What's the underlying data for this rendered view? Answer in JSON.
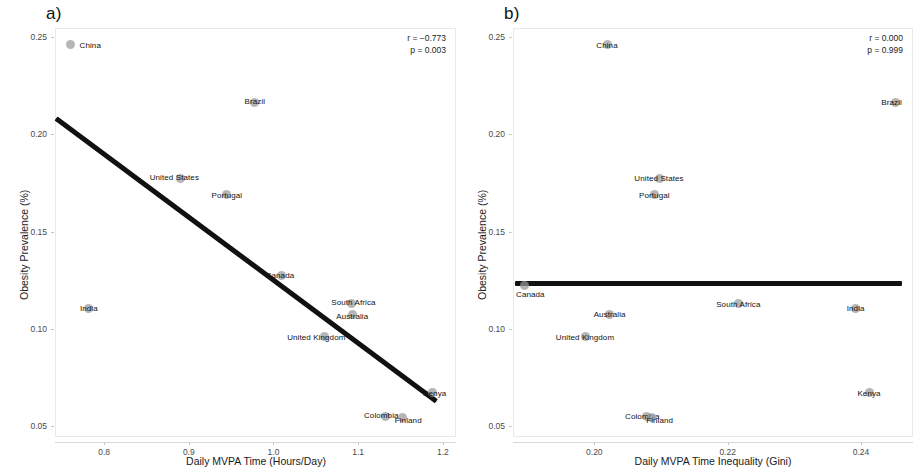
{
  "figure": {
    "panels": [
      {
        "letter": "a)",
        "stats": {
          "r": "r = −0.773",
          "p": "p = 0.003"
        },
        "chart_index": 0
      },
      {
        "letter": "b)",
        "stats": {
          "r": "r = 0.000",
          "p": "p = 0.999"
        },
        "chart_index": 1
      }
    ]
  },
  "chart_data": [
    {
      "type": "scatter",
      "title": "a)",
      "xlabel": "Daily MVPA Time (Hours/Day)",
      "ylabel": "Obesity Prevalence (%)",
      "xlim": [
        0.742,
        1.2155
      ],
      "ylim": [
        0.0446,
        0.2545
      ],
      "xticks": [
        0.8,
        0.9,
        1.0,
        1.1,
        1.2
      ],
      "xtick_labels": [
        "0.8",
        "0.9",
        "1.0",
        "1.1",
        "1.2"
      ],
      "yticks": [
        0.05,
        0.1,
        0.15,
        0.2,
        0.25
      ],
      "ytick_labels": [
        "0.05",
        "0.10",
        "0.15",
        "0.20",
        "0.25"
      ],
      "grid": false,
      "legend": false,
      "annotations": [
        "r = −0.773",
        "p = 0.003"
      ],
      "correlation_r": -0.773,
      "p_value": 0.003,
      "points": [
        {
          "label": "China",
          "x": 0.76,
          "y": 0.246,
          "label_dx": 20,
          "label_dy": 0
        },
        {
          "label": "Brazil",
          "x": 0.978,
          "y": 0.2163,
          "label_dx": 0,
          "label_dy": -1
        },
        {
          "label": "United States",
          "x": 0.89,
          "y": 0.1773,
          "label_dx": -6,
          "label_dy": -1
        },
        {
          "label": "Portugal",
          "x": 0.945,
          "y": 0.1688,
          "label_dx": 0,
          "label_dy": 0
        },
        {
          "label": "Canada",
          "x": 1.01,
          "y": 0.1275,
          "label_dx": -2,
          "label_dy": 0
        },
        {
          "label": "South Africa",
          "x": 1.092,
          "y": 0.113,
          "label_dx": 2,
          "label_dy": -2
        },
        {
          "label": "Australia",
          "x": 1.093,
          "y": 0.1075,
          "label_dx": 0,
          "label_dy": 2
        },
        {
          "label": "India",
          "x": 0.782,
          "y": 0.1108,
          "label_dx": 0,
          "label_dy": 0
        },
        {
          "label": "United Kingdom",
          "x": 1.06,
          "y": 0.096,
          "label_dx": -8,
          "label_dy": 0
        },
        {
          "label": "Kenya",
          "x": 1.188,
          "y": 0.0673,
          "label_dx": 2,
          "label_dy": 0
        },
        {
          "label": "Colombia",
          "x": 1.132,
          "y": 0.0553,
          "label_dx": -4,
          "label_dy": -1
        },
        {
          "label": "Finland",
          "x": 1.152,
          "y": 0.0545,
          "label_dx": 6,
          "label_dy": 2
        }
      ],
      "trend": {
        "x1": 0.7437,
        "y1": 0.2083,
        "x2": 1.1925,
        "y2": 0.0633
      }
    },
    {
      "type": "scatter",
      "title": "b)",
      "xlabel": "Daily MVPA Time Inequality (Gini)",
      "ylabel": "Obesity Prevalence (%)",
      "xlim": [
        0.1878,
        0.2478
      ],
      "ylim": [
        0.0446,
        0.2545
      ],
      "xticks": [
        0.2,
        0.22,
        0.24
      ],
      "xtick_labels": [
        "0.20",
        "0.22",
        "0.24"
      ],
      "yticks": [
        0.05,
        0.1,
        0.15,
        0.2,
        0.25
      ],
      "ytick_labels": [
        "0.05",
        "0.10",
        "0.15",
        "0.20",
        "0.25"
      ],
      "grid": false,
      "legend": false,
      "annotations": [
        "r = 0.000",
        "p = 0.999"
      ],
      "correlation_r": 0.0,
      "p_value": 0.999,
      "points": [
        {
          "label": "China",
          "x": 0.2019,
          "y": 0.246,
          "label_dx": 0,
          "label_dy": 0
        },
        {
          "label": "Brazil",
          "x": 0.2452,
          "y": 0.2163,
          "label_dx": -4,
          "label_dy": 0
        },
        {
          "label": "United States",
          "x": 0.2097,
          "y": 0.1773,
          "label_dx": 0,
          "label_dy": 0
        },
        {
          "label": "Portugal",
          "x": 0.209,
          "y": 0.1688,
          "label_dx": 0,
          "label_dy": 0
        },
        {
          "label": "Canada",
          "x": 0.1895,
          "y": 0.1225,
          "label_dx": 6,
          "label_dy": 9
        },
        {
          "label": "South Africa",
          "x": 0.2216,
          "y": 0.113,
          "label_dx": 0,
          "label_dy": 0
        },
        {
          "label": "India",
          "x": 0.2392,
          "y": 0.1108,
          "label_dx": 0,
          "label_dy": 0
        },
        {
          "label": "Australia",
          "x": 0.2023,
          "y": 0.1075,
          "label_dx": 0,
          "label_dy": 0
        },
        {
          "label": "United Kingdom",
          "x": 0.1986,
          "y": 0.096,
          "label_dx": 0,
          "label_dy": 0
        },
        {
          "label": "Kenya",
          "x": 0.2412,
          "y": 0.0673,
          "label_dx": 0,
          "label_dy": 0
        },
        {
          "label": "Colombia",
          "x": 0.2078,
          "y": 0.0553,
          "label_dx": -4,
          "label_dy": 0
        },
        {
          "label": "Finland",
          "x": 0.2086,
          "y": 0.0545,
          "label_dx": 8,
          "label_dy": 2
        }
      ],
      "trend": {
        "x1": 0.1881,
        "y1": 0.1235,
        "x2": 0.2462,
        "y2": 0.1235
      }
    }
  ]
}
